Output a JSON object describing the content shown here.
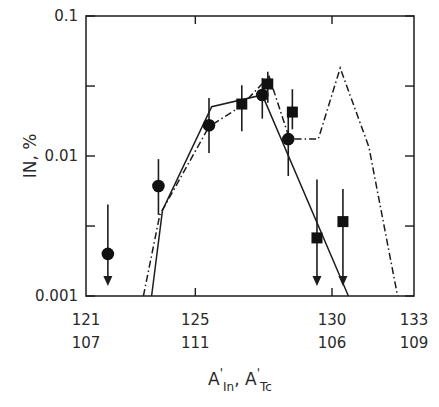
{
  "chart_data": {
    "type": "scatter",
    "title": "",
    "xlabel": "A'In, A'Tc",
    "xlabel_parts": {
      "a1": "A",
      "s1": "In",
      "sep": ", ",
      "a2": "A",
      "s2": "Tc",
      "prime": "'"
    },
    "ylabel": "IN, %",
    "yscale": "log",
    "ylim": [
      0.001,
      0.1
    ],
    "xlim": [
      121,
      133
    ],
    "y_ticks": [
      {
        "value": 0.1,
        "label": "0.1"
      },
      {
        "value": 0.01,
        "label": "0.01"
      },
      {
        "value": 0.001,
        "label": "0.001"
      }
    ],
    "x_ticks_primary": [
      {
        "value": 121,
        "label": "121"
      },
      {
        "value": 125,
        "label": "125"
      },
      {
        "value": 130,
        "label": "130"
      },
      {
        "value": 133,
        "label": "133"
      }
    ],
    "x_ticks_secondary": [
      {
        "value": 121,
        "label": "107"
      },
      {
        "value": 125,
        "label": "111"
      },
      {
        "value": 130,
        "label": "106"
      },
      {
        "value": 133,
        "label": "109"
      }
    ],
    "grid": false,
    "series": [
      {
        "name": "In (circles)",
        "marker": "circle",
        "points": [
          {
            "x": 121.8,
            "y": 0.002,
            "upper_limit": true,
            "err_hi": 0.0045
          },
          {
            "x": 123.65,
            "y": 0.0061,
            "err_lo": 0.0038,
            "err_hi": 0.0095
          },
          {
            "x": 125.5,
            "y": 0.0166,
            "err_lo": 0.0105,
            "err_hi": 0.026
          },
          {
            "x": 127.45,
            "y": 0.0273,
            "err_lo": 0.0185,
            "err_hi": 0.036
          },
          {
            "x": 128.4,
            "y": 0.0132,
            "err_lo": 0.0072,
            "err_hi": 0.02
          }
        ]
      },
      {
        "name": "Tc (squares)",
        "marker": "square",
        "points": [
          {
            "x": 126.7,
            "y": 0.0235,
            "err_lo": 0.015,
            "err_hi": 0.032
          },
          {
            "x": 127.65,
            "y": 0.0327,
            "err_lo": 0.024,
            "err_hi": 0.04
          },
          {
            "x": 128.55,
            "y": 0.0206,
            "err_lo": 0.0155,
            "err_hi": 0.03
          },
          {
            "x": 129.45,
            "y": 0.0026,
            "upper_limit": true,
            "err_hi": 0.0068
          },
          {
            "x": 130.4,
            "y": 0.0034,
            "upper_limit": true,
            "err_hi": 0.0058
          }
        ]
      },
      {
        "name": "Calculation (solid)",
        "line": "solid",
        "points": [
          {
            "x": 123.4,
            "y": 0.001
          },
          {
            "x": 123.8,
            "y": 0.0041
          },
          {
            "x": 125.6,
            "y": 0.0225
          },
          {
            "x": 127.45,
            "y": 0.0273
          },
          {
            "x": 130.6,
            "y": 0.001
          }
        ]
      },
      {
        "name": "Calculation (dash-dot)",
        "line": "dashdot",
        "points": [
          {
            "x": 123.1,
            "y": 0.001
          },
          {
            "x": 123.7,
            "y": 0.0038
          },
          {
            "x": 125.5,
            "y": 0.0162
          },
          {
            "x": 126.65,
            "y": 0.0225
          },
          {
            "x": 127.7,
            "y": 0.037
          },
          {
            "x": 128.45,
            "y": 0.0132
          },
          {
            "x": 129.5,
            "y": 0.0132
          },
          {
            "x": 130.3,
            "y": 0.0425
          },
          {
            "x": 131.35,
            "y": 0.0116
          },
          {
            "x": 132.4,
            "y": 0.001
          }
        ]
      }
    ]
  }
}
